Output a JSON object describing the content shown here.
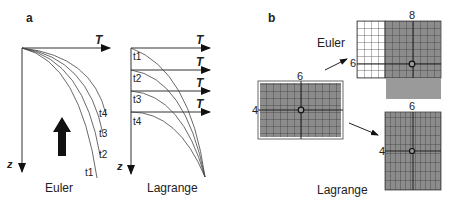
{
  "panel_a": {
    "label": "a",
    "euler": {
      "axis_x_label": "T",
      "axis_z_label": "z",
      "curve_labels": [
        "t1",
        "t2",
        "t3",
        "t4"
      ],
      "title": "Euler"
    },
    "lagrange": {
      "axis_x_labels": [
        "T",
        "T",
        "T",
        "T"
      ],
      "axis_z_label": "z",
      "curve_labels": [
        "t1",
        "t2",
        "t3",
        "t4"
      ],
      "title": "Lagrange"
    }
  },
  "panel_b": {
    "label": "b",
    "initial_grid": {
      "top_label": "6",
      "side_label": "4"
    },
    "euler_grid": {
      "title": "Euler",
      "top_label": "8",
      "side_label": "6"
    },
    "lagrange_grid": {
      "title": "Lagrange",
      "top_label": "6",
      "side_label": "4"
    }
  },
  "colors": {
    "line": "#333333",
    "grid_fill": "#8a8a8a",
    "grid_line": "#2a2a2a"
  }
}
